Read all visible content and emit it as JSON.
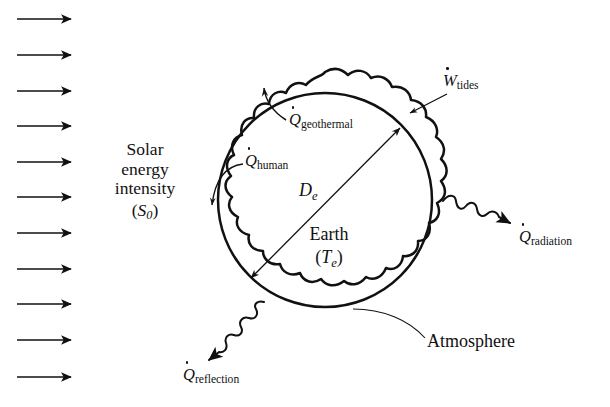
{
  "figure": {
    "background_color": "#ffffff",
    "line_color": "#111111"
  },
  "solar": {
    "line1": "Solar",
    "line2": "energy",
    "line3": "intensity",
    "symbol_open": "(",
    "symbol_var": "S",
    "symbol_sub": "0",
    "symbol_close": ")",
    "arrow_count": 11,
    "arrow_direction": "right"
  },
  "labels": {
    "geothermal": {
      "var": "Q",
      "dot": true,
      "sub": "geothermal"
    },
    "human": {
      "var": "Q",
      "dot": true,
      "sub": "human"
    },
    "tides": {
      "var": "W",
      "dot": true,
      "sub": "tides"
    },
    "radiation": {
      "var": "Q",
      "dot": true,
      "sub": "radiation"
    },
    "reflection": {
      "var": "Q",
      "dot": true,
      "sub": "reflection"
    },
    "diameter": {
      "var": "D",
      "sub": "e"
    },
    "earth_name": "Earth",
    "earth_temp_open": "(",
    "earth_temp_var": "T",
    "earth_temp_sub": "e",
    "earth_temp_close": ")",
    "atmosphere": "Atmosphere"
  },
  "geometry": {
    "earth_center_x": 325,
    "earth_center_y": 200,
    "earth_radius": 107,
    "atmosphere_radius": 128,
    "atmosphere_wave_lobes": 17
  }
}
